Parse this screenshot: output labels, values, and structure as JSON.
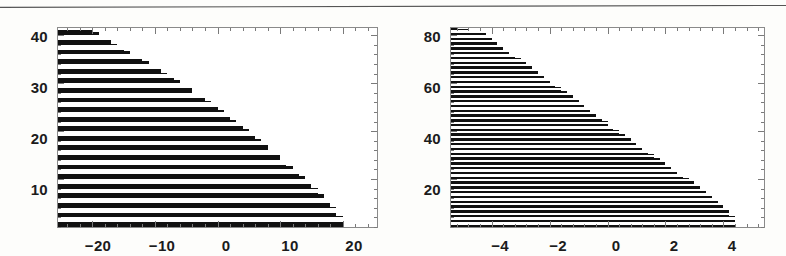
{
  "page": {
    "background_color": "#fdfdfb",
    "ink_color": "#111111",
    "frame_color": "#8a8a8a",
    "top_rule": {
      "present": true,
      "color": "#555555"
    }
  },
  "chart_data": [
    {
      "id": "left-plot",
      "type": "area",
      "title": "",
      "xlabel": "",
      "ylabel": "",
      "xlim": [
        -25.5,
        25.5
      ],
      "ylim": [
        0,
        41.5
      ],
      "grid": false,
      "legend": null,
      "xticks": [
        -20,
        -10,
        0,
        10,
        20
      ],
      "xtick_labels": [
        "-20",
        "-10",
        "0",
        "10",
        "20"
      ],
      "yticks": [
        10,
        20,
        30,
        40
      ],
      "ytick_labels": [
        "10",
        "20",
        "30",
        "40"
      ],
      "xminor_count": 4,
      "yminor_count": 4,
      "description": "black-and-white horizontally striped region; left part flat horizontal bands, right boundary a staircase-quantized quarter-ellipse-like curve reaching x=20 at bottom and tapering near y=41",
      "band_count": 21,
      "band_period_units": 2.0,
      "band_duty": 0.5,
      "envelope": {
        "kind": "staircase-curve",
        "x_step_units": 1.0,
        "y_step_units": 1.0,
        "points_x": [
          -25.5,
          -20.5,
          -19.5,
          -18.5,
          -17.0,
          -15.5,
          -13.5,
          -11.0,
          -8.5,
          -5.0,
          -1.0,
          2.5,
          6.0,
          9.0,
          11.5,
          14.0,
          16.0,
          17.5,
          18.7,
          19.6,
          20.2
        ],
        "points_y": [
          41.5,
          41.3,
          40.6,
          39.8,
          38.6,
          37.4,
          36.0,
          34.2,
          32.2,
          29.4,
          25.8,
          22.4,
          18.8,
          15.6,
          12.8,
          10.0,
          7.6,
          5.6,
          3.8,
          2.0,
          0.0
        ]
      }
    },
    {
      "id": "right-plot",
      "type": "area",
      "title": "",
      "xlabel": "",
      "ylabel": "",
      "xlim": [
        -5.4,
        5.4
      ],
      "ylim": [
        0,
        83
      ],
      "grid": false,
      "legend": null,
      "xticks": [
        -4,
        -2,
        0,
        2,
        4
      ],
      "xtick_labels": [
        "-4",
        "-2",
        "0",
        "2",
        "4"
      ],
      "yticks": [
        20,
        40,
        60,
        80
      ],
      "ytick_labels": [
        "20",
        "40",
        "60",
        "80"
      ],
      "xminor_count": 4,
      "yminor_count": 4,
      "description": "same motif with finer striping; left part flat horizontal thin bands, right boundary staircase-quantized curve reaching x=4.5 at bottom, vertical discontinuity at x=0 where stripe thickness changes",
      "band_count": 42,
      "band_period_units": 2.0,
      "band_duty": 0.5,
      "envelope": {
        "kind": "staircase-curve",
        "x_step_units": 0.2,
        "y_step_units": 1.0,
        "points_x": [
          -5.4,
          -4.4,
          -4.2,
          -3.9,
          -3.5,
          -3.0,
          -2.4,
          -1.7,
          -0.9,
          -0.1,
          0.7,
          1.5,
          2.2,
          2.9,
          3.4,
          3.9,
          4.2,
          4.4,
          4.5
        ],
        "points_y": [
          83.0,
          82.0,
          80.0,
          77.0,
          73.5,
          69.5,
          64.5,
          58.5,
          51.5,
          44.0,
          37.0,
          30.5,
          24.5,
          19.0,
          14.0,
          9.5,
          6.0,
          3.0,
          0.0
        ]
      }
    }
  ],
  "left_plot": {
    "frame": {
      "x": 57,
      "y": 27,
      "w": 321,
      "h": 201
    },
    "y_axis": {
      "labels": [
        "40",
        "30",
        "20",
        "10"
      ],
      "label_px_y": [
        36,
        87,
        138,
        189
      ]
    },
    "x_axis": {
      "labels": [
        "-20",
        "-10",
        "0",
        "10",
        "20"
      ],
      "label_px_x": [
        98,
        162,
        226,
        290,
        354
      ]
    }
  },
  "right_plot": {
    "frame": {
      "x": 450,
      "y": 27,
      "w": 315,
      "h": 201
    },
    "y_axis": {
      "labels": [
        "80",
        "60",
        "40",
        "20"
      ],
      "label_px_y": [
        36,
        87,
        138,
        189
      ]
    },
    "x_axis": {
      "labels": [
        "-4",
        "-2",
        "0",
        "2",
        "4"
      ],
      "label_px_x": [
        500,
        558,
        616,
        674,
        732
      ]
    }
  }
}
